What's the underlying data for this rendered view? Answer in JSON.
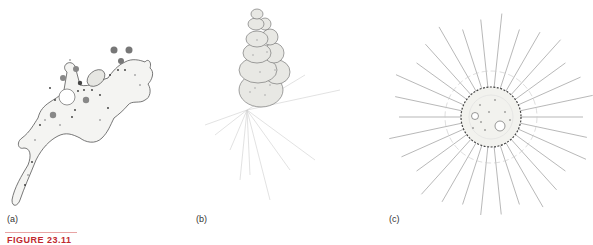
{
  "figure": {
    "caption_label": "FIGURE 23.11",
    "rule_color": "#e8a3a3",
    "caption_color": "#c0282e",
    "panels": [
      {
        "id": "a",
        "label": "(a)",
        "subject": "amoeba"
      },
      {
        "id": "b",
        "label": "(b)",
        "subject": "foraminiferan"
      },
      {
        "id": "c",
        "label": "(c)",
        "subject": "radiolarian"
      }
    ]
  }
}
